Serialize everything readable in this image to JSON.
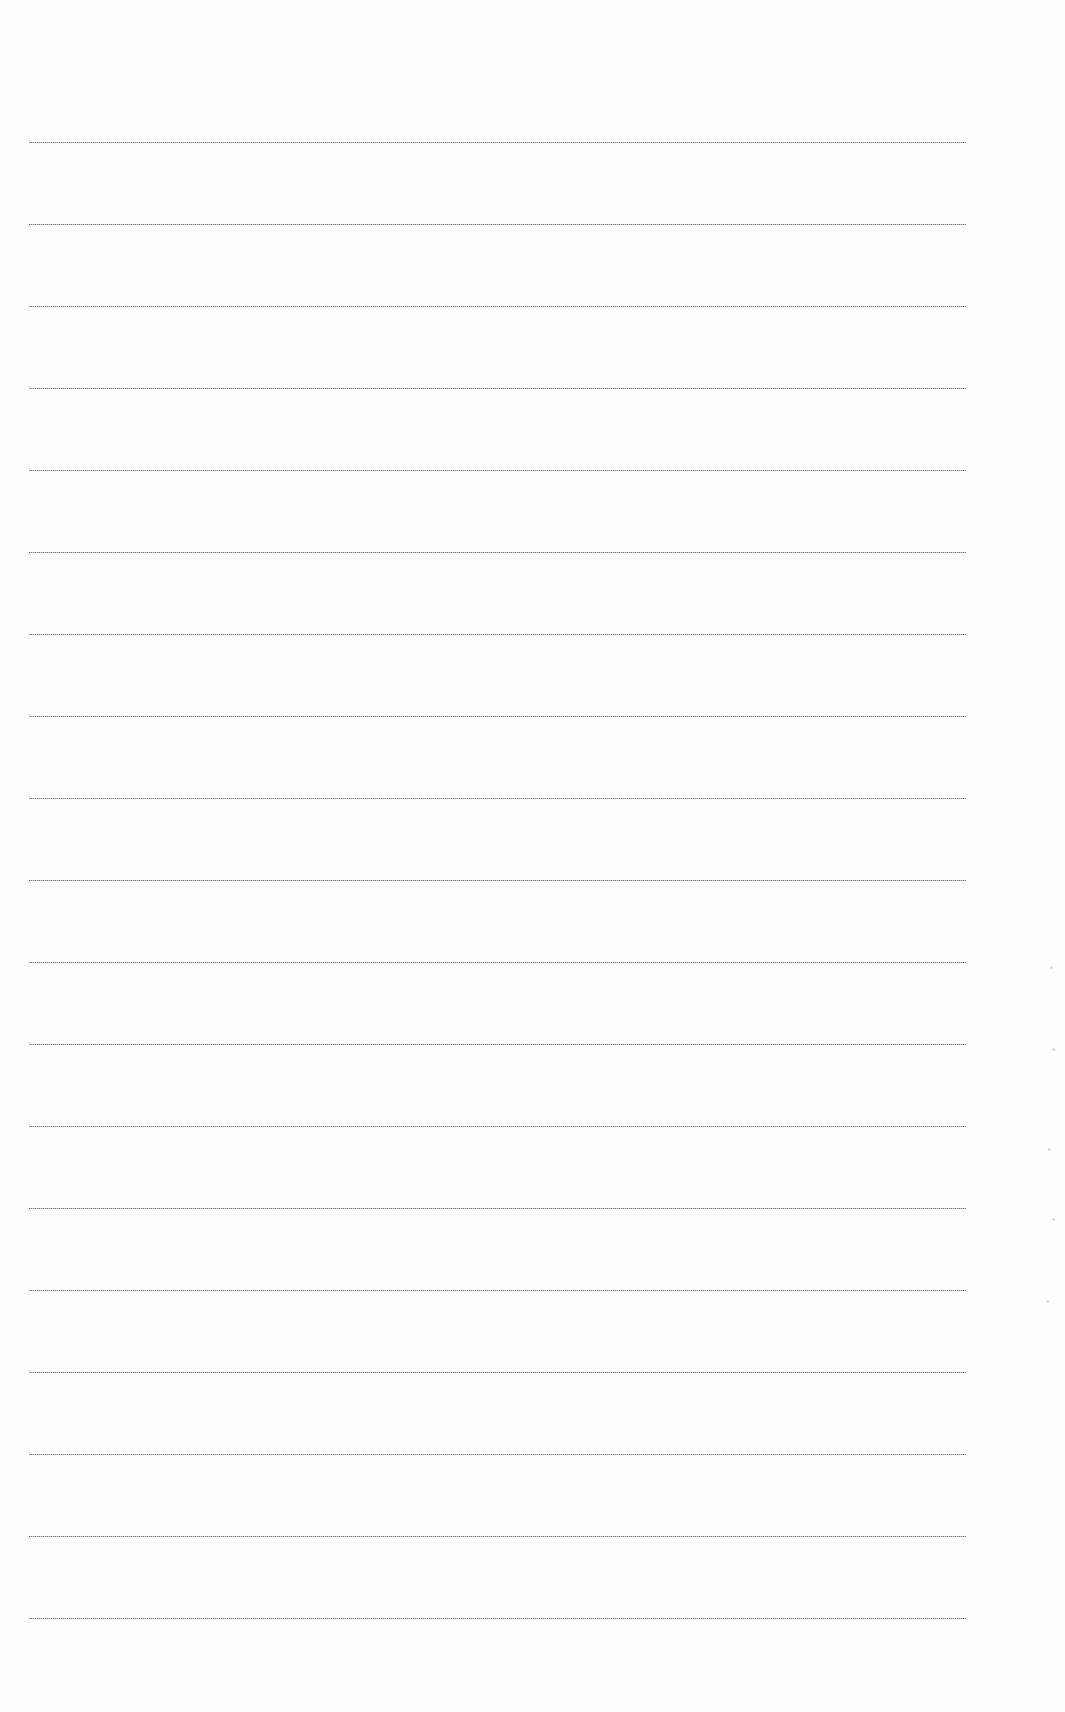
{
  "document": {
    "type": "lined-paper",
    "background": "#fefefe",
    "rule_color": "#8a8a8a",
    "rule_count": 19,
    "first_rule_y": 142,
    "rule_spacing": 82,
    "rule_left": 29,
    "rule_width": 937
  }
}
